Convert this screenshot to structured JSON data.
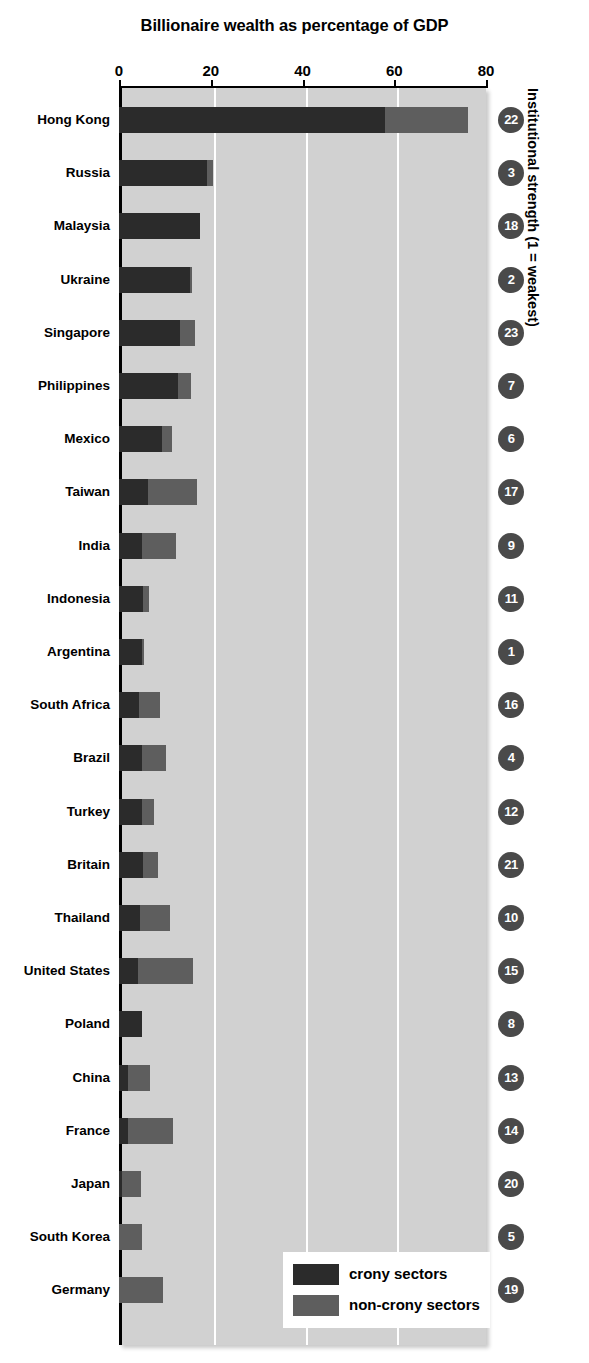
{
  "chart_data": {
    "type": "bar",
    "orientation": "horizontal",
    "stacked": true,
    "title": "Billionaire wealth as percentage of GDP",
    "xlabel": "",
    "ylabel": "",
    "right_axis_label": "Institutional strength (1 = weakest)",
    "xlim": [
      0,
      80
    ],
    "xticks": [
      0,
      20,
      40,
      60,
      80
    ],
    "xtick_labels": [
      "0",
      "20",
      "40",
      "60",
      "80"
    ],
    "grid": true,
    "legend_position": "bottom-right",
    "legend": [
      {
        "label": "crony sectors",
        "color": "#2b2b2b"
      },
      {
        "label": "non-crony sectors",
        "color": "#5e5e5e"
      }
    ],
    "series": [
      {
        "name": "crony sectors",
        "color": "#2b2b2b",
        "values": [
          58.0,
          19.2,
          17.7,
          15.5,
          13.3,
          12.9,
          9.4,
          6.3,
          5.0,
          5.2,
          5.0,
          4.4,
          5.0,
          5.0,
          5.2,
          4.6,
          4.2,
          5.0,
          2.0,
          2.0,
          0.7,
          0.0,
          0.0
        ]
      },
      {
        "name": "non-crony sectors",
        "color": "#5e5e5e",
        "values": [
          18.0,
          1.2,
          0.0,
          0.4,
          3.2,
          2.9,
          2.2,
          10.7,
          7.4,
          1.3,
          0.5,
          4.5,
          5.2,
          2.6,
          3.2,
          6.6,
          12.0,
          0.0,
          4.8,
          9.8,
          4.1,
          5.0,
          9.6
        ]
      }
    ],
    "categories": [
      "Hong Kong",
      "Russia",
      "Malaysia",
      "Ukraine",
      "Singapore",
      "Philippines",
      "Mexico",
      "Taiwan",
      "India",
      "Indonesia",
      "Argentina",
      "South Africa",
      "Brazil",
      "Turkey",
      "Britain",
      "Thailand",
      "United States",
      "Poland",
      "China",
      "France",
      "Japan",
      "South Korea",
      "Germany"
    ],
    "annotations": {
      "name": "institutional strength rank",
      "values": [
        22,
        3,
        18,
        2,
        23,
        7,
        6,
        17,
        9,
        11,
        1,
        16,
        4,
        12,
        21,
        10,
        15,
        8,
        13,
        14,
        20,
        5,
        19
      ]
    },
    "totals": [
      76.0,
      20.4,
      17.7,
      15.9,
      16.5,
      15.8,
      11.6,
      17.0,
      12.4,
      6.5,
      5.5,
      8.9,
      10.2,
      7.6,
      8.4,
      11.2,
      16.2,
      5.0,
      6.8,
      11.8,
      4.8,
      5.0,
      9.6
    ]
  },
  "colors": {
    "crony": "#2b2b2b",
    "non_crony": "#5e5e5e",
    "plot_background": "#d1d1d1",
    "gridline": "#ffffff",
    "badge": "#4a4a4a",
    "axis": "#000000"
  }
}
